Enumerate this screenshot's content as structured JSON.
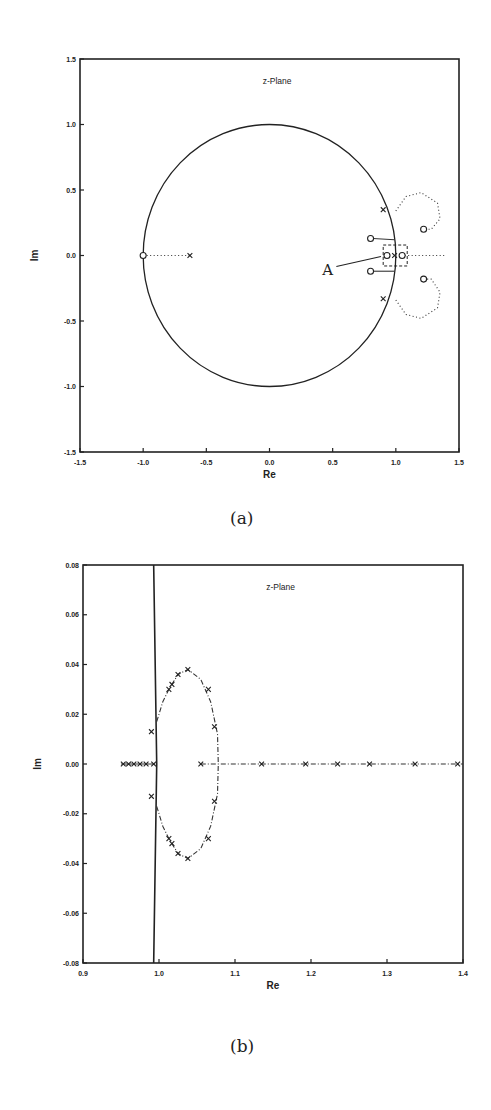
{
  "chart_data": [
    {
      "id": "a",
      "type": "scatter",
      "title": "z-Plane",
      "xlabel": "Re",
      "ylabel": "Im",
      "xlim": [
        -1.5,
        1.5
      ],
      "ylim": [
        -1.5,
        1.5
      ],
      "xticks": [
        -1.5,
        -1.0,
        -0.5,
        0.0,
        0.5,
        1.0,
        1.5
      ],
      "yticks": [
        1.5,
        1.0,
        0.5,
        0.0,
        -0.5,
        -1.0,
        -1.5
      ],
      "xtick_labels": [
        "-1.5",
        "-1.0",
        "-0.5",
        "0.0",
        "0.5",
        "1.0",
        "1.5"
      ],
      "ytick_labels": [
        "1.5",
        "1.0",
        "0.5",
        "0.0",
        "-0.5",
        "-1.0",
        "-1.5"
      ],
      "grid": false,
      "unit_circle": {
        "center": [
          0,
          0
        ],
        "radius": 1
      },
      "zeros": [
        [
          -1.0,
          0.0
        ],
        [
          0.8,
          0.13
        ],
        [
          0.8,
          -0.12
        ],
        [
          0.93,
          0.0
        ],
        [
          1.05,
          0.0
        ],
        [
          1.22,
          0.2
        ],
        [
          1.22,
          -0.18
        ]
      ],
      "poles": [
        [
          -0.63,
          0.0
        ],
        [
          0.9,
          0.35
        ],
        [
          0.9,
          -0.33
        ],
        [
          0.99,
          0.0
        ]
      ],
      "loci": [
        {
          "name": "real-left",
          "points": [
            [
              -1.0,
              0.0
            ],
            [
              -0.63,
              0.0
            ]
          ],
          "style": "dotted"
        },
        {
          "name": "upper-loop",
          "points": [
            [
              1.0,
              0.34
            ],
            [
              1.08,
              0.45
            ],
            [
              1.2,
              0.48
            ],
            [
              1.33,
              0.4
            ],
            [
              1.35,
              0.28
            ],
            [
              1.28,
              0.2
            ],
            [
              1.22,
              0.2
            ]
          ],
          "style": "dotted"
        },
        {
          "name": "lower-loop",
          "points": [
            [
              1.0,
              -0.34
            ],
            [
              1.08,
              -0.45
            ],
            [
              1.2,
              -0.48
            ],
            [
              1.33,
              -0.4
            ],
            [
              1.35,
              -0.28
            ],
            [
              1.28,
              -0.18
            ],
            [
              1.22,
              -0.18
            ]
          ],
          "style": "dotted"
        },
        {
          "name": "real-right",
          "points": [
            [
              1.07,
              0.0
            ],
            [
              1.4,
              0.0
            ]
          ],
          "style": "dotted"
        },
        {
          "name": "upper-short",
          "points": [
            [
              0.82,
              0.13
            ],
            [
              0.99,
              0.12
            ]
          ],
          "style": "solid"
        },
        {
          "name": "lower-short",
          "points": [
            [
              0.82,
              -0.12
            ],
            [
              0.99,
              -0.12
            ]
          ],
          "style": "solid"
        }
      ],
      "annotations": [
        {
          "text": "A",
          "target": [
            0.93,
            0.0
          ],
          "label_pos": [
            0.45,
            -0.13
          ]
        }
      ],
      "zoom_box": {
        "x": [
          0.9,
          1.09
        ],
        "y": [
          -0.08,
          0.08
        ]
      }
    },
    {
      "id": "b",
      "type": "scatter",
      "title": "z-Plane",
      "xlabel": "Re",
      "ylabel": "Im",
      "xlim": [
        0.9,
        1.4
      ],
      "ylim": [
        -0.08,
        0.08
      ],
      "xticks": [
        0.9,
        1.0,
        1.1,
        1.2,
        1.3,
        1.4
      ],
      "yticks": [
        0.08,
        0.06,
        0.04,
        0.02,
        0.0,
        -0.02,
        -0.04,
        -0.06,
        -0.08
      ],
      "xtick_labels": [
        "0.9",
        "1.0",
        "1.1",
        "1.2",
        "1.3",
        "1.4"
      ],
      "ytick_labels": [
        "0.08",
        "0.06",
        "0.04",
        "0.02",
        "0.00",
        "-0.02",
        "-0.04",
        "-0.06",
        "-0.08"
      ],
      "grid": false,
      "unit_circle_segment": [
        [
          0.993,
          0.08
        ],
        [
          0.997,
          0.0
        ],
        [
          0.993,
          -0.08
        ]
      ],
      "poles": [
        [
          0.953,
          0.0
        ],
        [
          0.96,
          0.0
        ],
        [
          0.967,
          0.0
        ],
        [
          0.975,
          0.0
        ],
        [
          0.983,
          0.0
        ],
        [
          0.993,
          0.0
        ],
        [
          0.99,
          0.013
        ],
        [
          0.99,
          -0.013
        ],
        [
          1.013,
          0.03
        ],
        [
          1.017,
          0.032
        ],
        [
          1.025,
          0.036
        ],
        [
          1.038,
          0.038
        ],
        [
          1.065,
          0.03
        ],
        [
          1.073,
          0.015
        ],
        [
          1.013,
          -0.03
        ],
        [
          1.017,
          -0.032
        ],
        [
          1.025,
          -0.036
        ],
        [
          1.038,
          -0.038
        ],
        [
          1.065,
          -0.03
        ],
        [
          1.073,
          -0.015
        ],
        [
          1.055,
          0.0
        ],
        [
          1.135,
          0.0
        ],
        [
          1.193,
          0.0
        ],
        [
          1.235,
          0.0
        ],
        [
          1.277,
          0.0
        ],
        [
          1.337,
          0.0
        ],
        [
          1.393,
          0.0
        ]
      ],
      "loci": [
        {
          "name": "upper-arc",
          "points": [
            [
              0.997,
              0.017
            ],
            [
              1.005,
              0.025
            ],
            [
              1.013,
              0.03
            ],
            [
              1.025,
              0.036
            ],
            [
              1.038,
              0.038
            ],
            [
              1.055,
              0.034
            ],
            [
              1.068,
              0.025
            ],
            [
              1.077,
              0.012
            ],
            [
              1.078,
              0.0
            ]
          ],
          "style": "dashdot"
        },
        {
          "name": "lower-arc",
          "points": [
            [
              0.997,
              -0.017
            ],
            [
              1.005,
              -0.025
            ],
            [
              1.013,
              -0.03
            ],
            [
              1.025,
              -0.036
            ],
            [
              1.038,
              -0.038
            ],
            [
              1.055,
              -0.034
            ],
            [
              1.068,
              -0.025
            ],
            [
              1.077,
              -0.012
            ],
            [
              1.078,
              0.0
            ]
          ],
          "style": "dashdot"
        },
        {
          "name": "real-axis",
          "points": [
            [
              1.055,
              0.0
            ],
            [
              1.4,
              0.0
            ]
          ],
          "style": "dashdot"
        },
        {
          "name": "real-left",
          "points": [
            [
              0.95,
              0.0
            ],
            [
              0.995,
              0.0
            ]
          ],
          "style": "solid"
        }
      ]
    }
  ],
  "captions": {
    "a": "(a)",
    "b": "(b)"
  }
}
